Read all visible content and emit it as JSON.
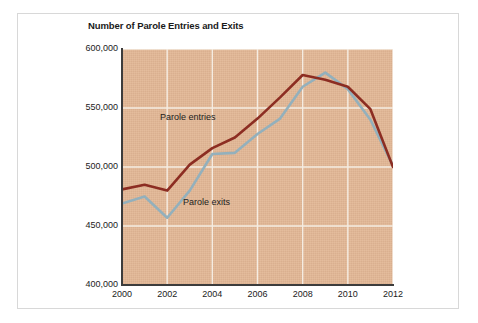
{
  "chart_data": {
    "type": "line",
    "title": "Number of Parole Entries and Exits",
    "xlabel": "",
    "ylabel": "",
    "x": [
      2000,
      2001,
      2002,
      2003,
      2004,
      2005,
      2006,
      2007,
      2008,
      2009,
      2010,
      2011,
      2012
    ],
    "xlim": [
      2000,
      2012
    ],
    "ylim": [
      400000,
      600000
    ],
    "ytick_labels": [
      "400,000",
      "450,000",
      "500,000",
      "550,000",
      "600,000"
    ],
    "yticks": [
      400000,
      450000,
      500000,
      550000,
      600000
    ],
    "xtick_labels": [
      "2000",
      "2002",
      "2004",
      "2006",
      "2008",
      "2010",
      "2012"
    ],
    "xticks": [
      2000,
      2002,
      2004,
      2006,
      2008,
      2010,
      2012
    ],
    "grid": true,
    "grid_color": "#f5ece2",
    "plot_background": "#e2b795",
    "legend": "inline-labels",
    "series": [
      {
        "name": "Parole entries",
        "color": "#8c2d22",
        "label_text": "Parole entries",
        "values": [
          481000,
          485000,
          480000,
          502000,
          516000,
          525000,
          541000,
          559000,
          578000,
          574000,
          568000,
          549000,
          500000
        ]
      },
      {
        "name": "Parole exits",
        "color": "#93b0bc",
        "label_text": "Parole exits",
        "values": [
          469000,
          475000,
          457000,
          480000,
          511000,
          512000,
          528000,
          541000,
          568000,
          580000,
          566000,
          540000,
          501000
        ]
      }
    ]
  },
  "chart": {
    "title": "Number of Parole Entries and Exits",
    "entries_label": "Parole entries",
    "exits_label": "Parole exits"
  }
}
